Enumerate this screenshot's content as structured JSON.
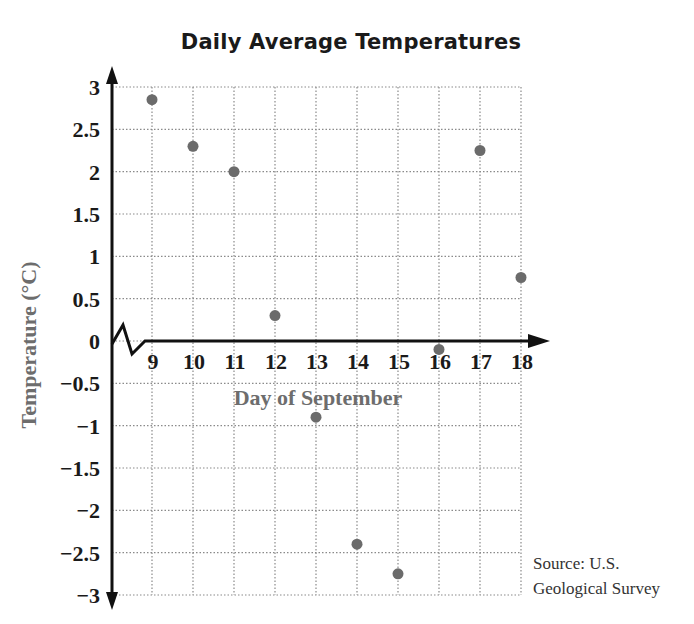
{
  "chart_data": {
    "type": "scatter",
    "title": "Daily Average Temperatures",
    "xlabel": "Day of September",
    "ylabel": "Temperature (°C)",
    "x": [
      9,
      10,
      11,
      12,
      13,
      14,
      15,
      16,
      17,
      18
    ],
    "y": [
      2.85,
      2.3,
      2.0,
      0.3,
      -0.9,
      -2.4,
      -2.75,
      -0.1,
      2.25,
      0.75
    ],
    "xlim": [
      8,
      18
    ],
    "ylim": [
      -3,
      3
    ],
    "x_ticks": [
      "9",
      "10",
      "11",
      "12",
      "13",
      "14",
      "15",
      "16",
      "17",
      "18"
    ],
    "y_ticks": [
      "3",
      "2.5",
      "2",
      "1.5",
      "1",
      "0.5",
      "0",
      "−0.5",
      "−1",
      "−1.5",
      "−2",
      "−2.5",
      "−3"
    ],
    "y_tick_values": [
      3,
      2.5,
      2,
      1.5,
      1,
      0.5,
      0,
      -0.5,
      -1,
      -1.5,
      -2,
      -2.5,
      -3
    ],
    "grid": true,
    "x_axis_break": true,
    "annotation": [
      "Source: U.S.",
      "Geological Survey"
    ],
    "colors": {
      "point": "#6b6b6b",
      "axis": "#111111",
      "grid": "#8a8a8a",
      "axis_label": "#6d6d6d"
    }
  }
}
